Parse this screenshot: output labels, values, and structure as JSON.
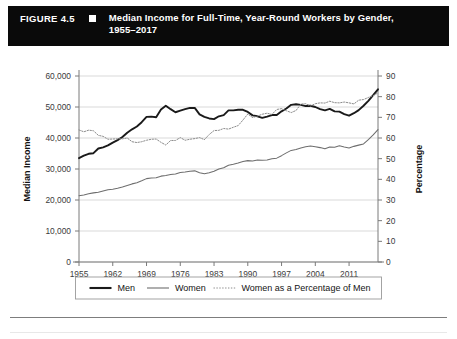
{
  "header": {
    "figure_number": "FIGURE 4.5",
    "marker_icon": "square-marker-icon",
    "title_line1": "Median Income for Full-Time, Year-Round Workers by Gender,",
    "title_line2": "1955–2017",
    "background_color": "#0a0a0a",
    "text_color": "#ffffff"
  },
  "chart_data": {
    "type": "line",
    "title": "Median Income for Full-Time, Year-Round Workers by Gender, 1955–2017",
    "xlabel": "",
    "ylabel": "Median Income",
    "y2label": "Percentage",
    "ylim": [
      0,
      60000
    ],
    "y2lim": [
      0,
      90
    ],
    "xlim": [
      1955,
      2017
    ],
    "grid": true,
    "legend_position": "bottom",
    "y_ticks": [
      "0",
      "10,000",
      "20,000",
      "30,000",
      "40,000",
      "50,000",
      "60,000"
    ],
    "y_tick_values": [
      0,
      10000,
      20000,
      30000,
      40000,
      50000,
      60000
    ],
    "y2_ticks": [
      "0",
      "10",
      "20",
      "30",
      "40",
      "50",
      "60",
      "70",
      "80",
      "90"
    ],
    "y2_tick_values": [
      0,
      10,
      20,
      30,
      40,
      50,
      60,
      70,
      80,
      90
    ],
    "x_ticks": [
      "1955",
      "1962",
      "1969",
      "1976",
      "1983",
      "1990",
      "1997",
      "2004",
      "2011"
    ],
    "x_tick_values": [
      1955,
      1962,
      1969,
      1976,
      1983,
      1990,
      1997,
      2004,
      2011
    ],
    "x": [
      1955,
      1956,
      1957,
      1958,
      1959,
      1960,
      1961,
      1962,
      1963,
      1964,
      1965,
      1966,
      1967,
      1968,
      1969,
      1970,
      1971,
      1972,
      1973,
      1974,
      1975,
      1976,
      1977,
      1978,
      1979,
      1980,
      1981,
      1982,
      1983,
      1984,
      1985,
      1986,
      1987,
      1988,
      1989,
      1990,
      1991,
      1992,
      1993,
      1994,
      1995,
      1996,
      1997,
      1998,
      1999,
      2000,
      2001,
      2002,
      2003,
      2004,
      2005,
      2006,
      2007,
      2008,
      2009,
      2010,
      2011,
      2012,
      2013,
      2014,
      2015,
      2016,
      2017
    ],
    "series": [
      {
        "name": "Men",
        "axis": "left",
        "style": "solid-thick",
        "color": "#1a1a1a",
        "values": [
          33500,
          34300,
          34900,
          35100,
          36600,
          37000,
          37600,
          38500,
          39300,
          40300,
          41700,
          42800,
          43700,
          45100,
          46800,
          46900,
          46700,
          49200,
          50400,
          49300,
          48300,
          48800,
          49300,
          49700,
          49700,
          47600,
          46800,
          46300,
          46100,
          47000,
          47400,
          48900,
          48900,
          49100,
          49100,
          48400,
          47300,
          47000,
          46500,
          46900,
          47400,
          47400,
          48600,
          49500,
          50700,
          50900,
          50700,
          50300,
          50400,
          50000,
          49300,
          48900,
          49400,
          48600,
          48500,
          47700,
          47200,
          48000,
          49000,
          50400,
          52000,
          53800,
          55700
        ]
      },
      {
        "name": "Women",
        "axis": "left",
        "style": "solid-thin",
        "color": "#6e6e6e",
        "values": [
          21400,
          21600,
          22000,
          22300,
          22500,
          22900,
          23300,
          23500,
          23800,
          24200,
          24700,
          25200,
          25600,
          26200,
          26900,
          27100,
          27200,
          27700,
          27900,
          28200,
          28400,
          28900,
          29000,
          29300,
          29400,
          28800,
          28500,
          28800,
          29300,
          30000,
          30400,
          31200,
          31500,
          31900,
          32400,
          32700,
          32600,
          32900,
          32800,
          32900,
          33300,
          33500,
          34300,
          35200,
          36000,
          36300,
          36800,
          37200,
          37400,
          37200,
          36900,
          36500,
          37100,
          37000,
          37500,
          37100,
          36800,
          37300,
          37700,
          38100,
          39500,
          41000,
          42700
        ]
      },
      {
        "name": "Women as a Percentage of Men",
        "axis": "right",
        "style": "dotted",
        "color": "#8c8c8c",
        "values": [
          63.9,
          63.0,
          63.8,
          63.5,
          61.3,
          60.8,
          59.4,
          59.5,
          59.6,
          59.6,
          60.0,
          58.2,
          57.8,
          58.2,
          58.9,
          59.4,
          59.5,
          57.9,
          56.6,
          58.8,
          58.8,
          60.2,
          58.9,
          59.4,
          59.7,
          60.2,
          59.2,
          61.7,
          63.6,
          63.7,
          64.6,
          64.3,
          65.2,
          66.0,
          68.7,
          71.6,
          69.9,
          70.6,
          71.5,
          72.0,
          71.4,
          73.8,
          74.2,
          73.2,
          72.3,
          73.3,
          76.4,
          76.6,
          75.5,
          76.6,
          77.0,
          76.9,
          77.8,
          77.1,
          77.0,
          77.4,
          77.0,
          76.5,
          78.3,
          78.6,
          79.6,
          80.5,
          81.8
        ]
      }
    ],
    "legend": [
      {
        "label": "Men",
        "style": "solid-thick",
        "color": "#1a1a1a"
      },
      {
        "label": "Women",
        "style": "solid-thin",
        "color": "#6e6e6e"
      },
      {
        "label": "Women as a Percentage of Men",
        "style": "dotted",
        "color": "#8c8c8c"
      }
    ]
  }
}
